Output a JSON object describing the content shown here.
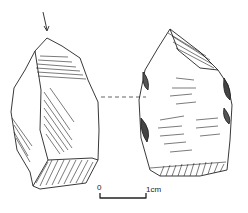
{
  "figure": {
    "views": [
      {
        "name": "left-view",
        "features": [
          "percussion arrow",
          "hatched facets",
          "striking platform"
        ]
      },
      {
        "name": "right-view",
        "features": [
          "flake scar ripples",
          "hatched platform",
          "shaded retouch"
        ]
      }
    ],
    "scale_bar": {
      "start_label": "0",
      "end_label": "1cm"
    },
    "colors": {
      "ink": "#222222",
      "background": "#ffffff"
    }
  }
}
